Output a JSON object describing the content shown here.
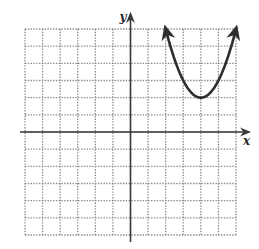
{
  "chart_data": {
    "type": "line",
    "title": "",
    "xlabel": "x",
    "ylabel": "y",
    "xlim": [
      -6,
      6
    ],
    "ylim": [
      -6,
      6
    ],
    "grid": true,
    "grid_style": "dotted",
    "grid_step": 1,
    "tick_labels": false,
    "legend": null,
    "series": [
      {
        "name": "parabola",
        "function": "y = (x - 4)^2 + 2",
        "vertex": [
          4,
          2
        ],
        "opens": "up",
        "arrows_on_ends": true,
        "x": [
          1.55,
          2,
          2.5,
          3,
          3.5,
          4,
          4.5,
          5,
          5.5,
          6,
          6.45
        ],
        "y": [
          8.0,
          6,
          4.25,
          3,
          2.25,
          2,
          2.25,
          3,
          4.25,
          6,
          8.0
        ],
        "visible_x_range": [
          2,
          6
        ],
        "endpoints": [
          [
            2,
            6
          ],
          [
            6,
            6
          ]
        ]
      }
    ]
  },
  "labels": {
    "x_axis": "x",
    "y_axis": "y"
  },
  "colors": {
    "grid": "#8a8a8a",
    "axes": "#3a3a3a",
    "curve": "#2e2e2e",
    "background": "#ffffff"
  }
}
